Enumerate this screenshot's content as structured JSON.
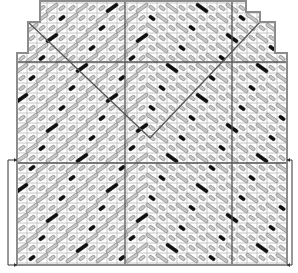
{
  "diagram": {
    "type": "knitting-lace-chart",
    "cell_size": 10,
    "colors": {
      "background": "#ffffff",
      "grid": "#b8b8b8",
      "outline": "#8c8c8c",
      "division": "#555555",
      "stitch_fill": "#c8c8c8",
      "stitch_stroke": "#777777",
      "accent_stitch": "#111111",
      "bracket": "#333333"
    },
    "outline_polygon": [
      [
        40,
        1
      ],
      [
        246,
        1
      ],
      [
        246,
        12
      ],
      [
        260,
        12
      ],
      [
        260,
        22
      ],
      [
        275,
        22
      ],
      [
        275,
        53
      ],
      [
        287,
        53
      ],
      [
        287,
        265
      ],
      [
        17,
        265
      ],
      [
        17,
        53
      ],
      [
        28,
        53
      ],
      [
        28,
        22
      ],
      [
        40,
        22
      ]
    ],
    "grid": {
      "x0": 17,
      "x1": 287,
      "y0": 1,
      "y1": 265,
      "step": 10
    },
    "division_lines": {
      "horizontal": [
        62,
        163
      ],
      "vertical": [
        125,
        232
      ]
    },
    "v_lines": [
      {
        "from": [
          28,
          22
        ],
        "to": [
          150,
          138
        ]
      },
      {
        "from": [
          260,
          22
        ],
        "to": [
          150,
          138
        ]
      }
    ],
    "repeat_brackets": [
      {
        "side": "left",
        "x": 8,
        "y_top": 160,
        "y_bottom": 265,
        "arrow_to_x": 17
      },
      {
        "side": "right",
        "x": 292,
        "y_top": 160,
        "y_bottom": 265,
        "arrow_to_x": 287
      }
    ],
    "legend": "diagonal gray elongated stitches with black accent stitches"
  }
}
